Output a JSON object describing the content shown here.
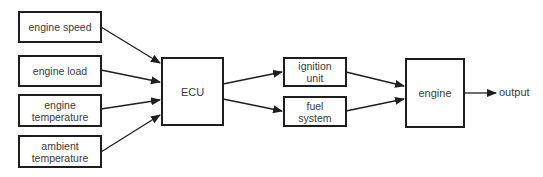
{
  "diagram": {
    "type": "block-diagram",
    "inputs": [
      {
        "id": "engine_speed",
        "label": "engine  speed"
      },
      {
        "id": "engine_load",
        "label": "engine  load"
      },
      {
        "id": "engine_temperature",
        "label": "engine\ntemperature"
      },
      {
        "id": "ambient_temperature",
        "label": "ambient\ntemperature"
      }
    ],
    "controller": {
      "id": "ecu",
      "label": "ECU"
    },
    "actuators": [
      {
        "id": "ignition_unit",
        "label": "ignition\nunit"
      },
      {
        "id": "fuel_system",
        "label": "fuel\nsystem"
      }
    ],
    "plant": {
      "id": "engine",
      "label": "engine"
    },
    "output": {
      "label": "output"
    },
    "edges": [
      {
        "from": "engine_speed",
        "to": "ecu"
      },
      {
        "from": "engine_load",
        "to": "ecu"
      },
      {
        "from": "engine_temperature",
        "to": "ecu"
      },
      {
        "from": "ambient_temperature",
        "to": "ecu"
      },
      {
        "from": "ecu",
        "to": "ignition_unit"
      },
      {
        "from": "ecu",
        "to": "fuel_system"
      },
      {
        "from": "ignition_unit",
        "to": "engine"
      },
      {
        "from": "fuel_system",
        "to": "engine"
      },
      {
        "from": "engine",
        "to": "output"
      }
    ],
    "colors": {
      "stroke": "#1e1e1e",
      "text": "#3a3a3a",
      "background": "#ffffff"
    }
  }
}
